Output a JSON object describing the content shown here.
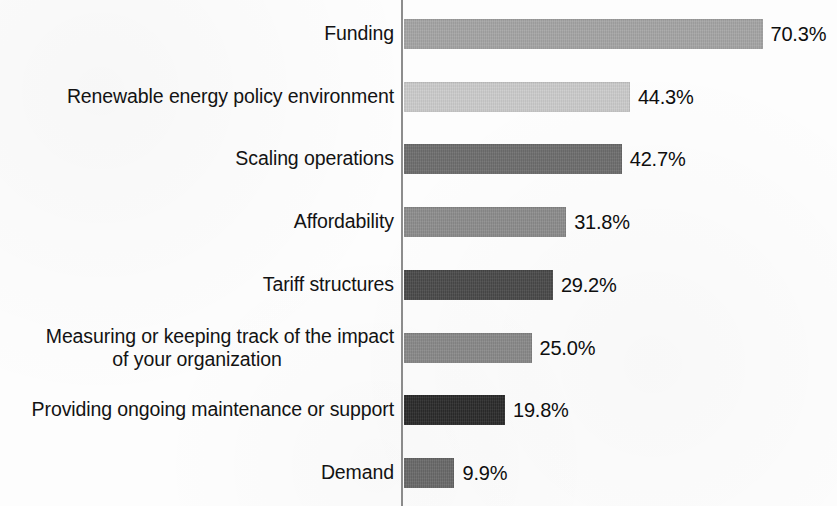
{
  "chart_data": {
    "type": "bar",
    "orientation": "horizontal",
    "title": "",
    "subtitle": "",
    "xlabel": "",
    "ylabel": "",
    "xlim": [
      0,
      75
    ],
    "grid": false,
    "legend": null,
    "value_suffix": "%",
    "categories": [
      "Funding",
      "Renewable energy policy environment",
      "Scaling operations",
      "Affordability",
      "Tariff structures",
      "Measuring or keeping track of the impact of your organization",
      "Providing ongoing maintenance or support",
      "Demand"
    ],
    "values": [
      70.3,
      44.3,
      42.7,
      31.8,
      29.2,
      25.0,
      19.8,
      9.9
    ],
    "value_labels": [
      "70.3%",
      "44.3%",
      "42.7%",
      "31.8%",
      "29.2%",
      "25.0%",
      "19.8%",
      "9.9%"
    ],
    "bar_colors": [
      "#a5a5a5",
      "#cccccc",
      "#6e6e6e",
      "#8d8d8d",
      "#4a4a4a",
      "#8a8a8a",
      "#2b2b2b",
      "#6a6a6a"
    ],
    "axis_color": "#8d8d8d",
    "text_color": "#131313",
    "background_color": "#fdfdfd",
    "bars": [
      {
        "category": "Funding",
        "label_lines": [
          "Funding"
        ],
        "value": 70.3,
        "value_label": "70.3%",
        "color": "#a5a5a5"
      },
      {
        "category": "Renewable energy policy environment",
        "label_lines": [
          "Renewable energy policy environment"
        ],
        "value": 44.3,
        "value_label": "44.3%",
        "color": "#cccccc"
      },
      {
        "category": "Scaling operations",
        "label_lines": [
          "Scaling operations"
        ],
        "value": 42.7,
        "value_label": "42.7%",
        "color": "#6e6e6e"
      },
      {
        "category": "Affordability",
        "label_lines": [
          "Affordability"
        ],
        "value": 31.8,
        "value_label": "31.8%",
        "color": "#8d8d8d"
      },
      {
        "category": "Tariff structures",
        "label_lines": [
          "Tariff structures"
        ],
        "value": 29.2,
        "value_label": "29.2%",
        "color": "#4a4a4a"
      },
      {
        "category": "Measuring or keeping track of the impact of your organization",
        "label_lines": [
          "Measuring or keeping track of the impact",
          "of your organization"
        ],
        "value": 25.0,
        "value_label": "25.0%",
        "color": "#8a8a8a"
      },
      {
        "category": "Providing ongoing maintenance or support",
        "label_lines": [
          "Providing ongoing maintenance or support"
        ],
        "value": 19.8,
        "value_label": "19.8%",
        "color": "#2b2b2b"
      },
      {
        "category": "Demand",
        "label_lines": [
          "Demand"
        ],
        "value": 9.9,
        "value_label": "9.9%",
        "color": "#6a6a6a"
      }
    ]
  },
  "layout": {
    "axis_x_px": 401,
    "bar_start_x_px": 404,
    "px_per_percent": 5.1,
    "bar_height_px": 30,
    "first_bar_top_px": 19,
    "row_pitch_px": 62.7,
    "value_gap_px": 8,
    "label_right_edge_px": 394
  }
}
